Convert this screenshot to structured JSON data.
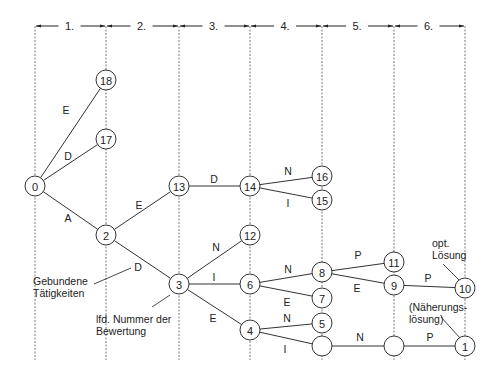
{
  "stages": [
    {
      "label": "1.",
      "x1": 35,
      "x2": 106
    },
    {
      "label": "2.",
      "x1": 106,
      "x2": 179
    },
    {
      "label": "3.",
      "x1": 179,
      "x2": 250
    },
    {
      "label": "4.",
      "x1": 250,
      "x2": 322
    },
    {
      "label": "5.",
      "x1": 322,
      "x2": 394
    },
    {
      "label": "6.",
      "x1": 394,
      "x2": 465
    }
  ],
  "stage_lines_x": [
    35,
    106,
    179,
    250,
    322,
    394,
    465
  ],
  "nodes": [
    {
      "id": "n0",
      "label": "0",
      "x": 35,
      "y": 186
    },
    {
      "id": "n18",
      "label": "18",
      "x": 106,
      "y": 80
    },
    {
      "id": "n17",
      "label": "17",
      "x": 106,
      "y": 139
    },
    {
      "id": "n2",
      "label": "2",
      "x": 106,
      "y": 235
    },
    {
      "id": "n13",
      "label": "13",
      "x": 179,
      "y": 186
    },
    {
      "id": "n3",
      "label": "3",
      "x": 179,
      "y": 284
    },
    {
      "id": "n14",
      "label": "14",
      "x": 250,
      "y": 186
    },
    {
      "id": "n12",
      "label": "12",
      "x": 250,
      "y": 235
    },
    {
      "id": "n6",
      "label": "6",
      "x": 250,
      "y": 284
    },
    {
      "id": "n4",
      "label": "4",
      "x": 250,
      "y": 330
    },
    {
      "id": "n16",
      "label": "16",
      "x": 322,
      "y": 176
    },
    {
      "id": "n15",
      "label": "15",
      "x": 322,
      "y": 200
    },
    {
      "id": "n8",
      "label": "8",
      "x": 322,
      "y": 272
    },
    {
      "id": "n7",
      "label": "7",
      "x": 322,
      "y": 298
    },
    {
      "id": "n5",
      "label": "5",
      "x": 322,
      "y": 323
    },
    {
      "id": "nE1",
      "label": "",
      "x": 322,
      "y": 346
    },
    {
      "id": "n11",
      "label": "11",
      "x": 394,
      "y": 262
    },
    {
      "id": "n9",
      "label": "9",
      "x": 394,
      "y": 285
    },
    {
      "id": "nE2",
      "label": "",
      "x": 394,
      "y": 346
    },
    {
      "id": "n10",
      "label": "10",
      "x": 465,
      "y": 288
    },
    {
      "id": "n1",
      "label": "1",
      "x": 465,
      "y": 346
    }
  ],
  "edges": [
    {
      "from": "n0",
      "to": "n18",
      "label": "E",
      "lx": 66,
      "ly": 114
    },
    {
      "from": "n0",
      "to": "n17",
      "label": "D",
      "lx": 68,
      "ly": 160
    },
    {
      "from": "n0",
      "to": "n2",
      "label": "A",
      "lx": 68,
      "ly": 222
    },
    {
      "from": "n2",
      "to": "n13",
      "label": "E",
      "lx": 139,
      "ly": 209
    },
    {
      "from": "n2",
      "to": "n3",
      "label": "",
      "lx": 0,
      "ly": 0
    },
    {
      "from": "n13",
      "to": "n14",
      "label": "D",
      "lx": 214,
      "ly": 183
    },
    {
      "from": "n14",
      "to": "n16",
      "label": "N",
      "lx": 288,
      "ly": 175
    },
    {
      "from": "n14",
      "to": "n15",
      "label": "I",
      "lx": 288,
      "ly": 207
    },
    {
      "from": "n3",
      "to": "n12",
      "label": "N",
      "lx": 216,
      "ly": 251
    },
    {
      "from": "n3",
      "to": "n6",
      "label": "I",
      "lx": 214,
      "ly": 281
    },
    {
      "from": "n3",
      "to": "n4",
      "label": "E",
      "lx": 213,
      "ly": 322
    },
    {
      "from": "n6",
      "to": "n8",
      "label": "N",
      "lx": 288,
      "ly": 273
    },
    {
      "from": "n6",
      "to": "n7",
      "label": "E",
      "lx": 287,
      "ly": 306
    },
    {
      "from": "n4",
      "to": "n5",
      "label": "N",
      "lx": 287,
      "ly": 322
    },
    {
      "from": "n4",
      "to": "nE1",
      "label": "I",
      "lx": 285,
      "ly": 353
    },
    {
      "from": "n8",
      "to": "n11",
      "label": "P",
      "lx": 358,
      "ly": 259
    },
    {
      "from": "n8",
      "to": "n9",
      "label": "E",
      "lx": 357,
      "ly": 292
    },
    {
      "from": "n9",
      "to": "n10",
      "label": "P",
      "lx": 428,
      "ly": 282
    },
    {
      "from": "nE1",
      "to": "nE2",
      "label": "N",
      "lx": 360,
      "ly": 341
    },
    {
      "from": "nE2",
      "to": "n1",
      "label": "P",
      "lx": 430,
      "ly": 341
    }
  ],
  "annotations": [
    {
      "id": "activities",
      "lines": [
        "Gebundene",
        "Tätigkeiten"
      ],
      "x": 33,
      "y": 285,
      "pointer": {
        "x1": 94,
        "y1": 284,
        "x2": 131,
        "y2": 268
      },
      "pointer_label": {
        "text": "D",
        "x": 138,
        "y": 271
      }
    },
    {
      "id": "eval-number",
      "lines": [
        "lfd. Nummer der",
        "Bewertung"
      ],
      "x": 96,
      "y": 323,
      "pointer": {
        "x1": 152,
        "y1": 307,
        "x2": 170,
        "y2": 295
      }
    },
    {
      "id": "optimal",
      "lines": [
        "opt.",
        "Lösung"
      ],
      "x": 432,
      "y": 247,
      "pointer": {
        "x1": 443,
        "y1": 264,
        "x2": 459,
        "y2": 280
      }
    },
    {
      "id": "approx",
      "lines": [
        "(Näherungs-",
        "lösung)"
      ],
      "x": 409,
      "y": 311,
      "pointer": {
        "x1": 441,
        "y1": 317,
        "x2": 460,
        "y2": 338
      }
    }
  ],
  "style": {
    "line_color": "#333333",
    "dash_color": "#555555",
    "node_radius": 10
  }
}
